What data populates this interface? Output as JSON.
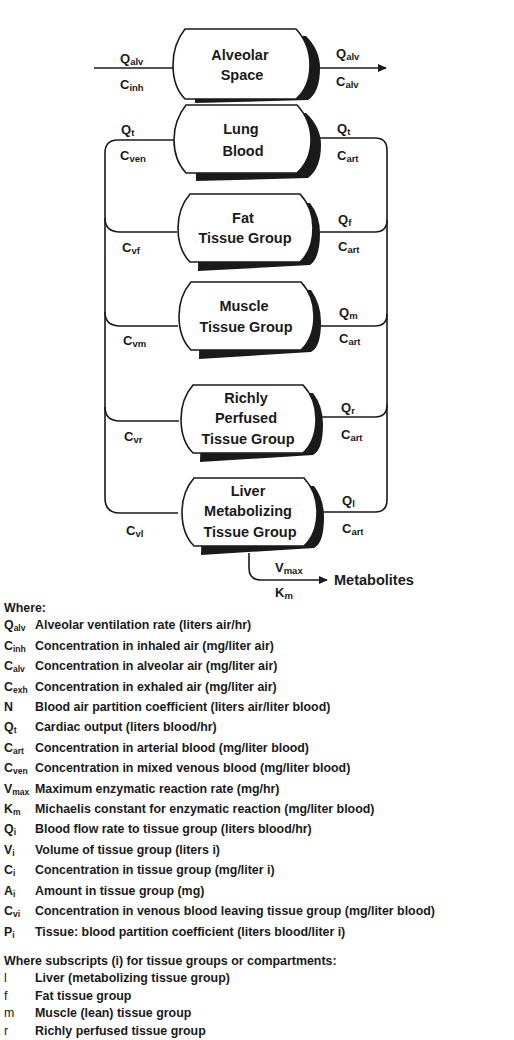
{
  "diagram": {
    "compartments": [
      {
        "id": "alveolar",
        "lines": [
          "Alveolar",
          "Space"
        ]
      },
      {
        "id": "lung",
        "lines": [
          "Lung",
          "Blood"
        ]
      },
      {
        "id": "fat",
        "lines": [
          "Fat",
          "Tissue Group"
        ]
      },
      {
        "id": "muscle",
        "lines": [
          "Muscle",
          "Tissue Group"
        ]
      },
      {
        "id": "richly",
        "lines": [
          "Richly",
          "Perfused",
          "Tissue Group"
        ]
      },
      {
        "id": "liver",
        "lines": [
          "Liver",
          "Metabolizing",
          "Tissue Group"
        ]
      }
    ],
    "labels": {
      "alv_in_q": {
        "main": "Q",
        "sub": "alv"
      },
      "alv_in_c": {
        "main": "C",
        "sub": "inh"
      },
      "alv_out_q": {
        "main": "Q",
        "sub": "alv"
      },
      "alv_out_c": {
        "main": "C",
        "sub": "alv"
      },
      "lung_in_q": {
        "main": "Q",
        "sub": "t"
      },
      "lung_in_c": {
        "main": "C",
        "sub": "ven"
      },
      "lung_out_q": {
        "main": "Q",
        "sub": "t"
      },
      "lung_out_c": {
        "main": "C",
        "sub": "art"
      },
      "fat_c": {
        "main": "C",
        "sub": "vf"
      },
      "fat_q": {
        "main": "Q",
        "sub": "f"
      },
      "fat_cart": {
        "main": "C",
        "sub": "art"
      },
      "muscle_c": {
        "main": "C",
        "sub": "vm"
      },
      "muscle_q": {
        "main": "Q",
        "sub": "m"
      },
      "muscle_cart": {
        "main": "C",
        "sub": "art"
      },
      "richly_c": {
        "main": "C",
        "sub": "vr"
      },
      "richly_q": {
        "main": "Q",
        "sub": "r"
      },
      "richly_cart": {
        "main": "C",
        "sub": "art"
      },
      "liver_c": {
        "main": "C",
        "sub": "vl"
      },
      "liver_q": {
        "main": "Q",
        "sub": "l"
      },
      "liver_cart": {
        "main": "C",
        "sub": "art"
      },
      "vmax": {
        "main": "V",
        "sub": "max"
      },
      "km": {
        "main": "K",
        "sub": "m"
      },
      "metabolites": "Metabolites"
    },
    "colors": {
      "ink": "#1a1a1a",
      "background": "#ffffff"
    }
  },
  "legend": {
    "header": "Where:",
    "items": [
      {
        "main": "Q",
        "sub": "alv",
        "desc": "Alveolar ventilation rate (liters air/hr)"
      },
      {
        "main": "C",
        "sub": "inh",
        "desc": "Concentration in inhaled air (mg/liter air)"
      },
      {
        "main": "C",
        "sub": "alv",
        "desc": "Concentration in alveolar air (mg/liter air)"
      },
      {
        "main": "C",
        "sub": "exh",
        "desc": "Concentration in exhaled air (mg/liter air)"
      },
      {
        "main": "N",
        "sub": "",
        "desc": "Blood air partition coefficient (liters air/liter blood)"
      },
      {
        "main": "Q",
        "sub": "t",
        "desc": "Cardiac output (liters blood/hr)"
      },
      {
        "main": "C",
        "sub": "art",
        "desc": "Concentration in arterial blood (mg/liter blood)"
      },
      {
        "main": "C",
        "sub": "ven",
        "desc": "Concentration in mixed venous blood (mg/liter blood)"
      },
      {
        "main": "V",
        "sub": "max",
        "desc": "Maximum enzymatic reaction rate (mg/hr)"
      },
      {
        "main": "K",
        "sub": "m",
        "desc": "Michaelis constant for enzymatic reaction (mg/liter blood)"
      },
      {
        "main": "Q",
        "sub": "i",
        "desc": "Blood flow rate to tissue group (liters blood/hr)"
      },
      {
        "main": "V",
        "sub": "i",
        "desc": "Volume of tissue group (liters i)"
      },
      {
        "main": "C",
        "sub": "i",
        "desc": "Concentration in tissue group (mg/liter i)"
      },
      {
        "main": "A",
        "sub": "i",
        "desc": "Amount in tissue group (mg)"
      },
      {
        "main": "C",
        "sub": "vi",
        "desc": "Concentration in venous blood leaving tissue group (mg/liter blood)"
      },
      {
        "main": "P",
        "sub": "i",
        "desc": "Tissue: blood partition coefficient (liters blood/liter i)"
      }
    ],
    "subscripts_header": "Where subscripts (i) for tissue groups or compartments:",
    "subscripts": [
      {
        "main": "l",
        "desc": "Liver (metabolizing tissue group)"
      },
      {
        "main": "f",
        "desc": "Fat tissue group"
      },
      {
        "main": "m",
        "desc": "Muscle (lean) tissue group"
      },
      {
        "main": "r",
        "desc": "Richly perfused tissue group"
      }
    ]
  }
}
